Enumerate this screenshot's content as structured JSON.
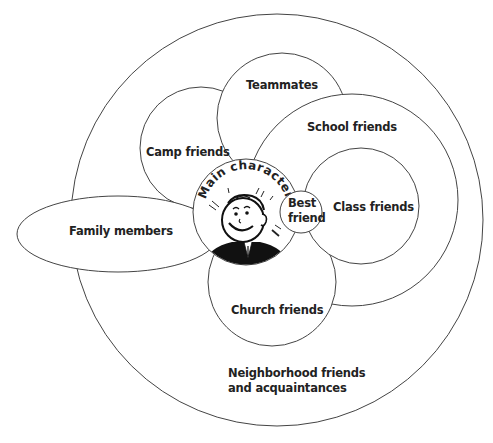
{
  "diagram": {
    "type": "social-circles",
    "colors": {
      "stroke": "#444444",
      "text": "#222222",
      "fill": "#ffffff",
      "shirt": "#111111"
    },
    "center": {
      "label": "Main character",
      "icon": "smiling-boy-icon"
    },
    "circles": [
      {
        "id": "neighborhood",
        "label_line1": "Neighborhood friends",
        "label_line2": "and acquaintances"
      },
      {
        "id": "family",
        "label": "Family members"
      },
      {
        "id": "camp",
        "label": "Camp friends"
      },
      {
        "id": "teammates",
        "label": "Teammates"
      },
      {
        "id": "school",
        "label": "School friends"
      },
      {
        "id": "class",
        "label": "Class friends"
      },
      {
        "id": "church",
        "label": "Church friends"
      },
      {
        "id": "best",
        "label_line1": "Best",
        "label_line2": "friend"
      }
    ]
  }
}
